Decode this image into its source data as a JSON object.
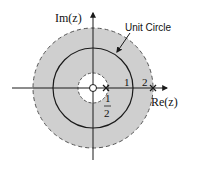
{
  "diagram": {
    "axes": {
      "x_label": "Re(z)",
      "y_label": "Im(z)"
    },
    "annotation": "Unit Circle",
    "ticks": {
      "one": "1",
      "two": "2",
      "half_num": "1",
      "half_den": "2"
    },
    "colors": {
      "roc_fill": "#cfcfcf",
      "line": "#1a1a1a",
      "background": "#ffffff"
    },
    "regions": [
      {
        "name": "outer-boundary",
        "radius": 2,
        "style": "dashed"
      },
      {
        "name": "unit-circle",
        "radius": 1,
        "style": "solid"
      },
      {
        "name": "inner-boundary",
        "radius": 0.5,
        "style": "dashed"
      }
    ],
    "markers": [
      {
        "type": "pole",
        "position": 0.5,
        "symbol": "x"
      },
      {
        "type": "pole",
        "position": 2,
        "symbol": "x"
      },
      {
        "type": "zero",
        "position": 0,
        "symbol": "o"
      }
    ]
  }
}
